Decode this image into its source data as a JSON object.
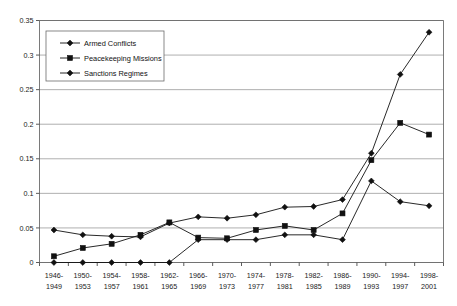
{
  "chart_data": {
    "type": "line",
    "title": "",
    "subtitle": "",
    "xlabel": "",
    "ylabel": "",
    "ylim": [
      0,
      0.35
    ],
    "ytick_labels": [
      "0",
      "0.05",
      "0.1",
      "0.15",
      "0.2",
      "0.25",
      "0.3",
      "0.35"
    ],
    "ytick_values": [
      0,
      0.05,
      0.1,
      0.15,
      0.2,
      0.25,
      0.3,
      0.35
    ],
    "grid": true,
    "legend_position": "top-left-inside",
    "categories": [
      "1946-\n1949",
      "1950-\n1953",
      "1954-\n1957",
      "1958-\n1961",
      "1962-\n1965",
      "1966-\n1969",
      "1970-\n1973",
      "1974-\n1977",
      "1978-\n1981",
      "1982-\n1985",
      "1986-\n1989",
      "1990-\n1993",
      "1994-\n1997",
      "1998-\n2001"
    ],
    "categories_line1": [
      "1946-",
      "1950-",
      "1954-",
      "1958-",
      "1962-",
      "1966-",
      "1970-",
      "1974-",
      "1978-",
      "1982-",
      "1986-",
      "1990-",
      "1994-",
      "1998-"
    ],
    "categories_line2": [
      "1949",
      "1953",
      "1957",
      "1961",
      "1965",
      "1969",
      "1973",
      "1977",
      "1981",
      "1985",
      "1989",
      "1993",
      "1997",
      "2001"
    ],
    "series": [
      {
        "name": "Armed Conflicts",
        "marker": "diamond",
        "color": "#111111",
        "values": [
          0.047,
          0.04,
          0.038,
          0.037,
          0.057,
          0.066,
          0.064,
          0.069,
          0.08,
          0.081,
          0.091,
          0.158,
          0.272,
          0.333
        ]
      },
      {
        "name": "Peacekeeping Missions",
        "marker": "square",
        "color": "#111111",
        "values": [
          0.009,
          0.021,
          0.027,
          0.04,
          0.058,
          0.036,
          0.035,
          0.047,
          0.053,
          0.047,
          0.071,
          0.148,
          0.202,
          0.185
        ]
      },
      {
        "name": "Sanctions Regimes",
        "marker": "diamond",
        "color": "#111111",
        "values": [
          0.0,
          0.0,
          0.0,
          0.0,
          0.0,
          0.033,
          0.033,
          0.033,
          0.04,
          0.04,
          0.033,
          0.118,
          0.088,
          0.082
        ]
      }
    ]
  },
  "legend": {
    "items": [
      {
        "label": "Armed Conflicts",
        "marker": "diamond"
      },
      {
        "label": "Peacekeeping Missions",
        "marker": "square"
      },
      {
        "label": "Sanctions Regimes",
        "marker": "diamond"
      }
    ]
  }
}
